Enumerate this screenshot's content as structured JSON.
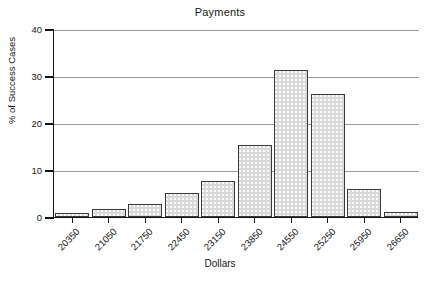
{
  "chart_data": {
    "type": "bar",
    "title": "Payments",
    "xlabel": "Dollars",
    "ylabel": "% of Success Cases",
    "categories": [
      "20350",
      "21050",
      "21750",
      "22450",
      "23150",
      "23850",
      "24550",
      "25250",
      "25950",
      "26650"
    ],
    "values": [
      0.9,
      1.7,
      2.7,
      5.2,
      7.7,
      15.4,
      31.3,
      26.2,
      5.9,
      1.1
    ],
    "ylim": [
      0,
      40
    ],
    "yticks": [
      0,
      10,
      20,
      30,
      40
    ],
    "ytick_labels": [
      "0",
      "10",
      "20",
      "30",
      "40"
    ],
    "grid": true,
    "legend": "none",
    "bar_color": "#d9d9d9",
    "bar_edge_color": "#3a3a3a",
    "axis_color": "#141414",
    "grid_color": "#9a9a9a"
  }
}
